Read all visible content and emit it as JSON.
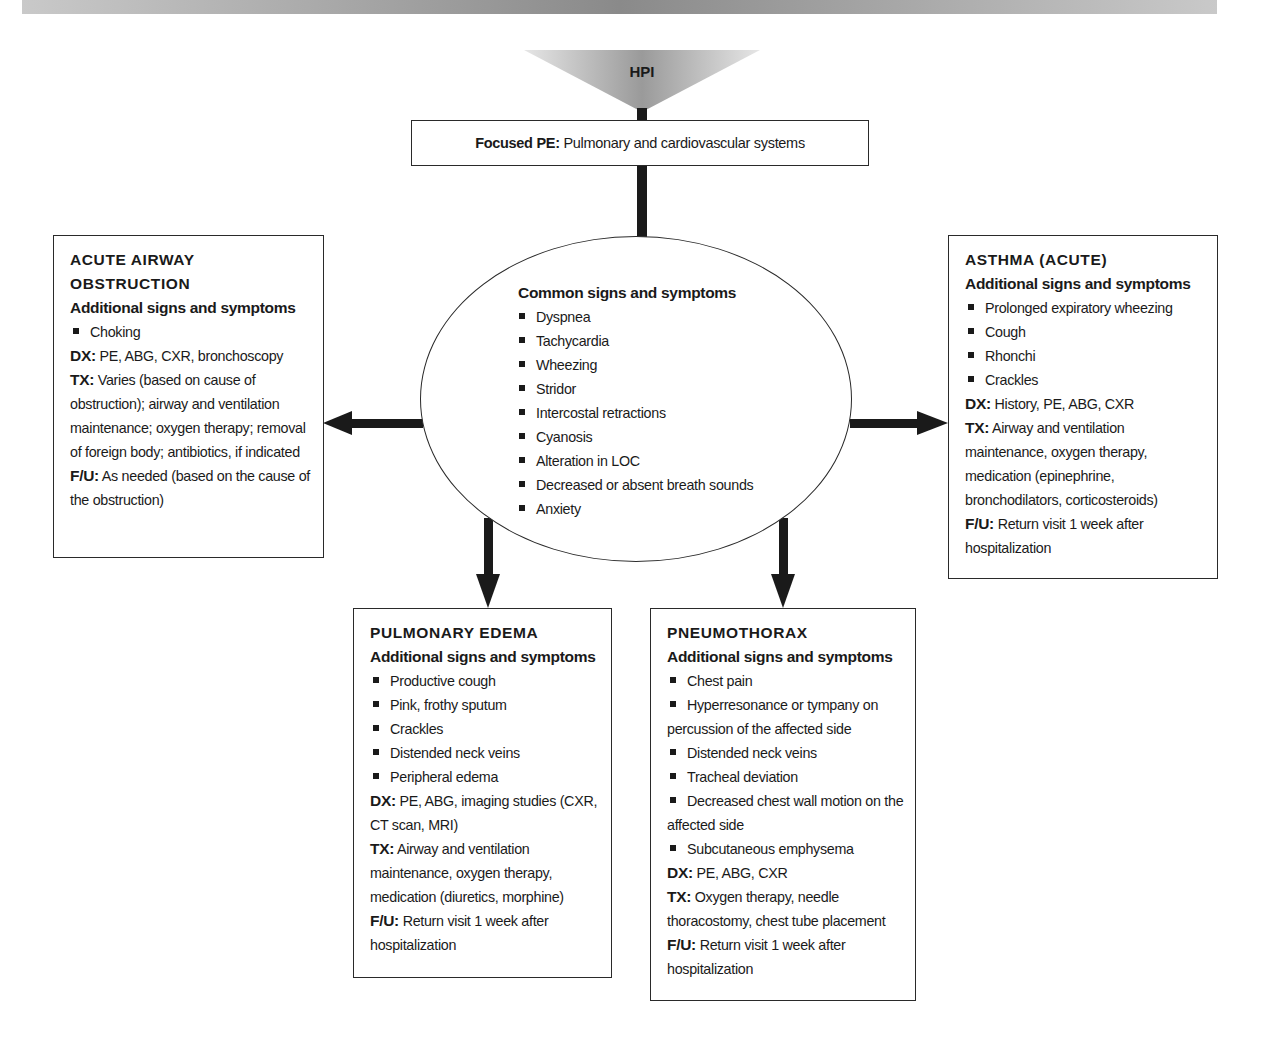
{
  "diagram": {
    "start": {
      "label": "HPI",
      "icon": "triangle-down-gradient"
    },
    "focused_pe": {
      "label": "Focused PE:",
      "text": "Pulmonary and cardiovascular systems"
    },
    "common": {
      "heading": "Common signs and symptoms",
      "items": [
        "Dyspnea",
        "Tachycardia",
        "Wheezing",
        "Stridor",
        "Intercostal retractions",
        "Cyanosis",
        "Alteration in LOC",
        "Decreased or absent breath sounds",
        "Anxiety"
      ]
    },
    "acute_airway": {
      "title_line1": "ACUTE AIRWAY",
      "title_line2": "OBSTRUCTION",
      "sub": "Additional signs and symptoms",
      "items": [
        "Choking"
      ],
      "dx_label": "DX:",
      "dx": "PE, ABG, CXR, bronchoscopy",
      "tx_label": "TX:",
      "tx": "Varies (based on cause of obstruction); airway and ventilation maintenance; oxygen therapy; removal of foreign body; antibiotics, if indicated",
      "fu_label": "F/U:",
      "fu": "As needed (based on the cause of the obstruction)"
    },
    "asthma": {
      "title": "ASTHMA (ACUTE)",
      "sub": "Additional signs and symptoms",
      "items": [
        "Prolonged expiratory wheezing",
        "Cough",
        "Rhonchi",
        "Crackles"
      ],
      "dx_label": "DX:",
      "dx": "History, PE, ABG, CXR",
      "tx_label": "TX:",
      "tx": "Airway and ventilation maintenance, oxygen therapy, medication (epinephrine, bronchodilators, corticosteroids)",
      "fu_label": "F/U:",
      "fu": "Return visit 1 week after hospitalization"
    },
    "pulmonary_edema": {
      "title": "PULMONARY EDEMA",
      "sub": "Additional signs and symptoms",
      "items": [
        "Productive cough",
        "Pink, frothy sputum",
        "Crackles",
        "Distended neck veins",
        "Peripheral edema"
      ],
      "dx_label": "DX:",
      "dx": "PE, ABG, imaging studies (CXR, CT scan, MRI)",
      "tx_label": "TX:",
      "tx": "Airway and ventilation maintenance, oxygen therapy, medication (diuretics, morphine)",
      "fu_label": "F/U:",
      "fu": "Return visit 1 week after hospitalization"
    },
    "pneumothorax": {
      "title": "PNEUMOTHORAX",
      "sub": "Additional signs and symptoms",
      "items": [
        "Chest pain",
        "Hyperresonance or tympany on percussion of the affected side",
        "Distended neck veins",
        "Tracheal deviation",
        "Decreased chest wall motion on the affected side",
        "Subcutaneous emphysema"
      ],
      "dx_label": "DX:",
      "dx": "PE, ABG, CXR",
      "tx_label": "TX:",
      "tx": "Oxygen therapy, needle thoracostomy, chest tube placement",
      "fu_label": "F/U:",
      "fu": "Return visit 1 week after hospitalization"
    },
    "colors": {
      "line": "#1a1a1a",
      "border": "#2a2a2a",
      "header_bar": "#8a8a8a"
    }
  }
}
